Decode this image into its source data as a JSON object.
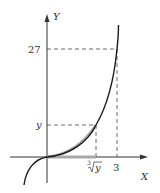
{
  "diagram": {
    "axes": {
      "x_label": "X",
      "y_label": "Y"
    },
    "ticks": {
      "y_27": "27",
      "y_var": "y",
      "x_3": "3",
      "x_cuberoot_index": "3",
      "x_cuberoot_radicand": "y"
    },
    "colors": {
      "curve": "#1a1a1a",
      "highlight": "#a8a8a8",
      "axis": "#333333",
      "dashed": "#444444"
    }
  }
}
